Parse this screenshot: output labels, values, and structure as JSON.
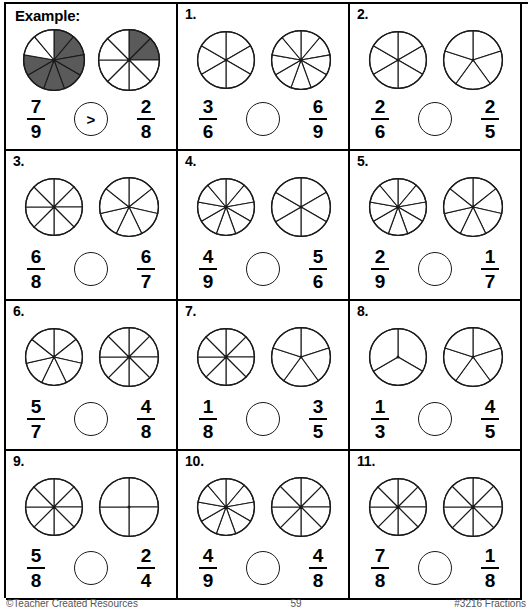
{
  "worksheet": {
    "example_label": "Example:",
    "footer_left": "©Teacher Created Resources",
    "footer_center": "59",
    "footer_right": "#3216 Fractions"
  },
  "operator_options": [
    ">",
    "<",
    "="
  ],
  "problems": [
    {
      "id": "example",
      "label": "Example:",
      "is_example": true,
      "left": {
        "numerator": "7",
        "denominator": "9",
        "slices": 9,
        "shaded": 7
      },
      "right": {
        "numerator": "2",
        "denominator": "8",
        "slices": 8,
        "shaded": 2
      },
      "operator": ">"
    },
    {
      "id": "p1",
      "label": "1.",
      "is_example": false,
      "left": {
        "numerator": "3",
        "denominator": "6",
        "slices": 6,
        "shaded": 0
      },
      "right": {
        "numerator": "6",
        "denominator": "9",
        "slices": 9,
        "shaded": 0
      },
      "operator": ""
    },
    {
      "id": "p2",
      "label": "2.",
      "is_example": false,
      "left": {
        "numerator": "2",
        "denominator": "6",
        "slices": 6,
        "shaded": 0
      },
      "right": {
        "numerator": "2",
        "denominator": "5",
        "slices": 5,
        "shaded": 0
      },
      "operator": ""
    },
    {
      "id": "p3",
      "label": "3.",
      "is_example": false,
      "left": {
        "numerator": "6",
        "denominator": "8",
        "slices": 8,
        "shaded": 0
      },
      "right": {
        "numerator": "6",
        "denominator": "7",
        "slices": 7,
        "shaded": 0
      },
      "operator": ""
    },
    {
      "id": "p4",
      "label": "4.",
      "is_example": false,
      "left": {
        "numerator": "4",
        "denominator": "9",
        "slices": 9,
        "shaded": 0
      },
      "right": {
        "numerator": "5",
        "denominator": "6",
        "slices": 6,
        "shaded": 0
      },
      "operator": ""
    },
    {
      "id": "p5",
      "label": "5.",
      "is_example": false,
      "left": {
        "numerator": "2",
        "denominator": "9",
        "slices": 9,
        "shaded": 0
      },
      "right": {
        "numerator": "1",
        "denominator": "7",
        "slices": 7,
        "shaded": 0
      },
      "operator": ""
    },
    {
      "id": "p6",
      "label": "6.",
      "is_example": false,
      "left": {
        "numerator": "5",
        "denominator": "7",
        "slices": 7,
        "shaded": 0
      },
      "right": {
        "numerator": "4",
        "denominator": "8",
        "slices": 8,
        "shaded": 0
      },
      "operator": ""
    },
    {
      "id": "p7",
      "label": "7.",
      "is_example": false,
      "left": {
        "numerator": "1",
        "denominator": "8",
        "slices": 8,
        "shaded": 0
      },
      "right": {
        "numerator": "3",
        "denominator": "5",
        "slices": 5,
        "shaded": 0
      },
      "operator": ""
    },
    {
      "id": "p8",
      "label": "8.",
      "is_example": false,
      "left": {
        "numerator": "1",
        "denominator": "3",
        "slices": 3,
        "shaded": 0
      },
      "right": {
        "numerator": "4",
        "denominator": "5",
        "slices": 5,
        "shaded": 0
      },
      "operator": ""
    },
    {
      "id": "p9",
      "label": "9.",
      "is_example": false,
      "left": {
        "numerator": "5",
        "denominator": "8",
        "slices": 8,
        "shaded": 0
      },
      "right": {
        "numerator": "2",
        "denominator": "4",
        "slices": 4,
        "shaded": 0
      },
      "operator": ""
    },
    {
      "id": "p10",
      "label": "10.",
      "is_example": false,
      "left": {
        "numerator": "4",
        "denominator": "9",
        "slices": 9,
        "shaded": 0
      },
      "right": {
        "numerator": "4",
        "denominator": "8",
        "slices": 8,
        "shaded": 0
      },
      "operator": ""
    },
    {
      "id": "p11",
      "label": "11.",
      "is_example": false,
      "left": {
        "numerator": "7",
        "denominator": "8",
        "slices": 8,
        "shaded": 0
      },
      "right": {
        "numerator": "1",
        "denominator": "8",
        "slices": 8,
        "shaded": 0
      },
      "operator": ""
    }
  ],
  "colors": {
    "shaded_fill": "#5a5a5a",
    "unshaded_fill": "#ffffff",
    "stroke": "#1a1a1a",
    "border": "#000000"
  }
}
